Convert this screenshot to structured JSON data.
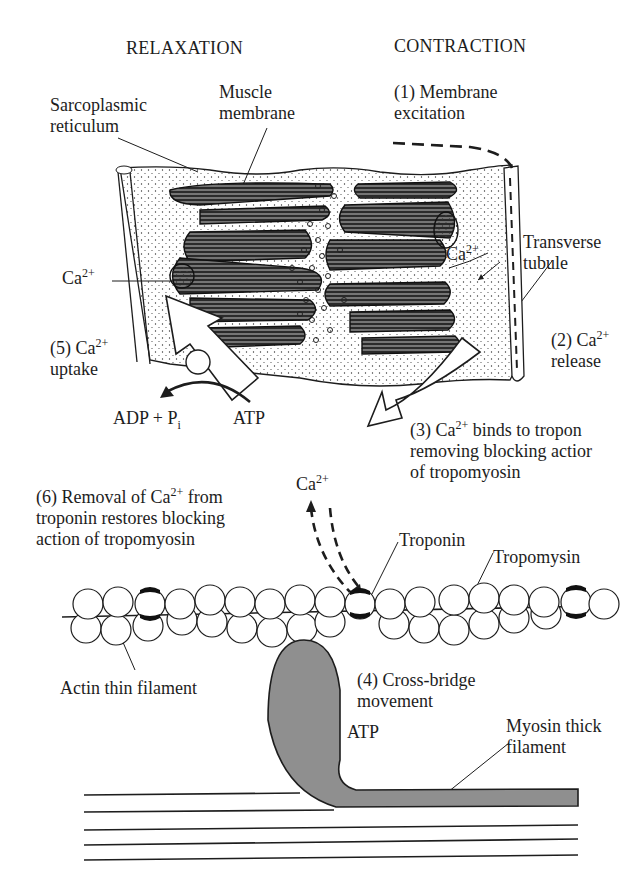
{
  "headers": {
    "relaxation": "RELAXATION",
    "contraction": "CONTRACTION"
  },
  "labels": {
    "sarcoplasmic_reticulum": [
      "Sarcoplasmic",
      "reticulum"
    ],
    "muscle_membrane": [
      "Muscle",
      "membrane"
    ],
    "step1": [
      "(1) Membrane",
      "excitation"
    ],
    "transverse_tubule": [
      "Transverse",
      "tubule"
    ],
    "ca_left": {
      "base": "Ca",
      "sup": "2+"
    },
    "ca_right": {
      "base": "Ca",
      "sup": "2+"
    },
    "step2": {
      "prefix": "(2) Ca",
      "sup": "2+",
      "line2": "release"
    },
    "step5": {
      "prefix": "(5) Ca",
      "sup": "2+",
      "line2": "uptake"
    },
    "adp_pi": {
      "text": "ADP + P",
      "sub": "i"
    },
    "atp_top": "ATP",
    "step3": {
      "prefix": "(3) Ca",
      "sup": "2+",
      "line1_rest": " binds to tropon",
      "line2": "removing blocking actior",
      "line3": "of tropomyosin"
    },
    "step6": {
      "prefix": "(6) Removal of Ca",
      "sup": "2+",
      "line1_rest": " from",
      "line2": "troponin restores blocking",
      "line3": "action of tropomyosin"
    },
    "ca_mid": {
      "base": "Ca",
      "sup": "2+"
    },
    "troponin": "Troponin",
    "tropomysin": "Tropomysin",
    "actin_thin_filament": "Actin thin filament",
    "step4": [
      "(4) Cross-bridge",
      "movement"
    ],
    "atp_bottom": "ATP",
    "myosin_thick_filament": [
      "Myosin thick",
      "filament"
    ]
  },
  "colors": {
    "ink": "#1d1d1d",
    "myosin_fill": "#8f8f8f",
    "background": "#ffffff"
  }
}
